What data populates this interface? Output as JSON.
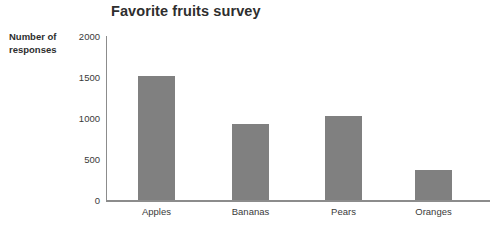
{
  "chart_data": {
    "type": "bar",
    "title": "Favorite fruits survey",
    "xlabel": "",
    "ylabel": "Number of responses",
    "categories": [
      "Apples",
      "Bananas",
      "Pears",
      "Oranges"
    ],
    "values": [
      1515,
      930,
      1030,
      365
    ],
    "ylim": [
      0,
      2000
    ],
    "yticks": [
      0,
      500,
      1000,
      1500,
      2000
    ],
    "ytick_labels": [
      "0",
      "500",
      "1000",
      "1500",
      "2000"
    ],
    "grid": false,
    "legend": null,
    "bar_color": "#808080",
    "axis_color": "#8c8c8c",
    "background_color": "#ffffff",
    "text_color": "#3a3a3a"
  }
}
